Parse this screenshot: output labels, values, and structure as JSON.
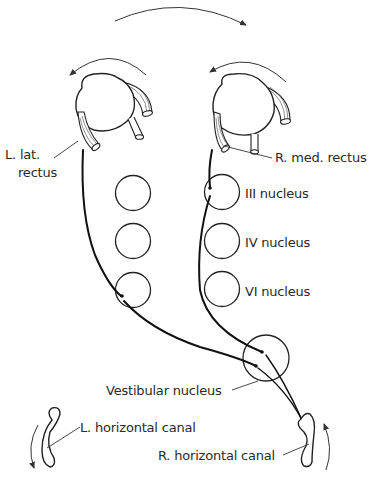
{
  "diagram": {
    "labels": {
      "left_lat_rectus_line1": "L. lat.",
      "left_lat_rectus_line2": "rectus",
      "right_med_rectus": "R. med. rectus",
      "iii_nucleus": "III nucleus",
      "iv_nucleus": "IV nucleus",
      "vi_nucleus": "VI nucleus",
      "vestibular_nucleus": "Vestibular nucleus",
      "left_horizontal_canal": "L. horizontal canal",
      "right_horizontal_canal": "R. horizontal canal"
    },
    "elements": [
      {
        "id": "head-rotation-arrow",
        "type": "curved-arrow",
        "direction": "clockwise (to the right)"
      },
      {
        "id": "left-eye",
        "type": "eyeball",
        "rotation_arrow": "counterclockwise (to the left)"
      },
      {
        "id": "right-eye",
        "type": "eyeball",
        "rotation_arrow": "counterclockwise (to the left)"
      },
      {
        "id": "left-column-nuclei",
        "type": "circles",
        "count": 3
      },
      {
        "id": "right-column-nuclei",
        "type": "circles",
        "count": 3
      },
      {
        "id": "vestibular-nucleus",
        "type": "circle"
      },
      {
        "id": "left-horizontal-canal",
        "type": "canal",
        "arrow": "downward"
      },
      {
        "id": "right-horizontal-canal",
        "type": "canal",
        "arrow": "upward"
      }
    ],
    "colors": {
      "line": "#222222",
      "background": "#ffffff"
    }
  }
}
